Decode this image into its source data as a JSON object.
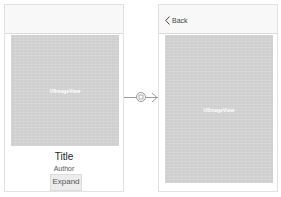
{
  "source_screen": {
    "image_label": "UIImageView",
    "title": "Title",
    "author": "Author",
    "expand_button": "Expand"
  },
  "segue": {
    "icon": "segue-push-icon",
    "arrow": "chevron-right-icon"
  },
  "destination_screen": {
    "back_button": "Back",
    "back_icon": "chevron-left-icon",
    "image_label": "UIImageView"
  },
  "colors": {
    "image_placeholder": "#cfcfcf",
    "navbar": "#f8f8f8",
    "border": "#e2e2e2"
  }
}
